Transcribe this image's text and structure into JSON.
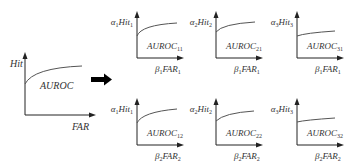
{
  "main_plot": {
    "y_label": "Hit",
    "x_label": "FAR",
    "area_label": "AUROC"
  },
  "transform_arrow": "right-arrow",
  "panels": [
    {
      "row": 1,
      "col": 1,
      "y_label": {
        "greek": "α",
        "g_sub": "1",
        "name": "Hit",
        "n_sub": "1"
      },
      "x_label": {
        "greek": "β",
        "g_sub": "1",
        "name": "FAR",
        "n_sub": "1"
      },
      "area_label": {
        "name": "AUROC",
        "sub": "11"
      }
    },
    {
      "row": 1,
      "col": 2,
      "y_label": {
        "greek": "α",
        "g_sub": "2",
        "name": "Hit",
        "n_sub": "2"
      },
      "x_label": {
        "greek": "β",
        "g_sub": "1",
        "name": "FAR",
        "n_sub": "1"
      },
      "area_label": {
        "name": "AUROC",
        "sub": "21"
      }
    },
    {
      "row": 1,
      "col": 3,
      "y_label": {
        "greek": "α",
        "g_sub": "3",
        "name": "Hit",
        "n_sub": "3"
      },
      "x_label": {
        "greek": "β",
        "g_sub": "1",
        "name": "FAR",
        "n_sub": "1"
      },
      "area_label": {
        "name": "AUROC",
        "sub": "31"
      }
    },
    {
      "row": 2,
      "col": 1,
      "y_label": {
        "greek": "α",
        "g_sub": "1",
        "name": "Hit",
        "n_sub": "1"
      },
      "x_label": {
        "greek": "β",
        "g_sub": "2",
        "name": "FAR",
        "n_sub": "2"
      },
      "area_label": {
        "name": "AUROC",
        "sub": "12"
      }
    },
    {
      "row": 2,
      "col": 2,
      "y_label": {
        "greek": "α",
        "g_sub": "2",
        "name": "Hit",
        "n_sub": "2"
      },
      "x_label": {
        "greek": "β",
        "g_sub": "2",
        "name": "FAR",
        "n_sub": "2"
      },
      "area_label": {
        "name": "AUROC",
        "sub": "22"
      }
    },
    {
      "row": 2,
      "col": 3,
      "y_label": {
        "greek": "α",
        "g_sub": "3",
        "name": "Hit",
        "n_sub": "3"
      },
      "x_label": {
        "greek": "β",
        "g_sub": "2",
        "name": "FAR",
        "n_sub": "2"
      },
      "area_label": {
        "name": "AUROC",
        "sub": "32"
      }
    }
  ]
}
